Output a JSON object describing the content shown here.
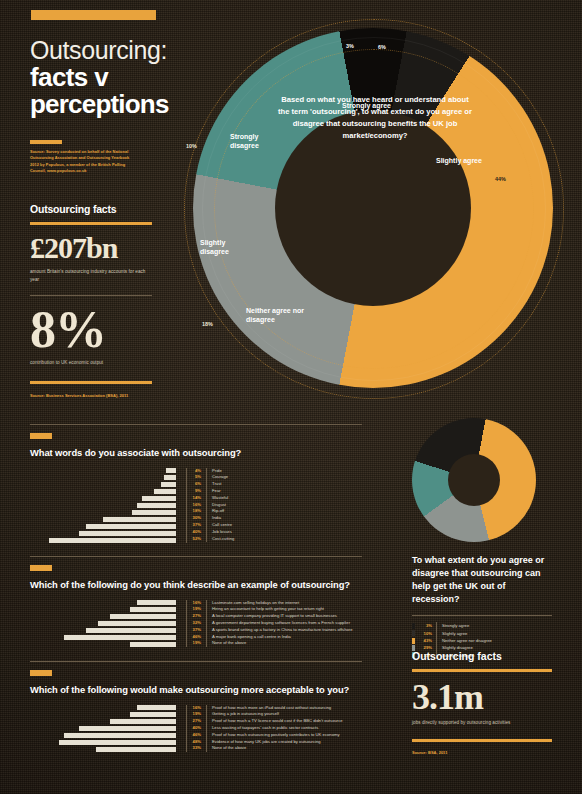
{
  "header": {
    "title_line1": "Outsourcing:",
    "title_line2": "facts v",
    "title_line3": "perceptions",
    "source": "Source: Survey conducted on behalf of the National Outsourcing Association and Outsourcing Yearbook 2012 by Populous, a member of the British Polling Council, www.populous.co.uk"
  },
  "facts_left": {
    "heading": "Outsourcing facts",
    "stat1_value": "£207bn",
    "stat1_caption": "amount Britain's outsourcing industry accounts for each year",
    "stat2_value": "8%",
    "stat2_caption": "contribution to UK economic output",
    "source": "Source: Business Services Association (BSA), 2011"
  },
  "main_donut": {
    "question": "Based on what you have heard or understand about the term 'outsourcing', to what extent do you agree or disagree that outsourcing benefits the UK job market/economy?",
    "labels": {
      "strongly_agree": "Strongly agree",
      "slightly_agree": "Slightly agree",
      "neither": "Neither agree nor disagree",
      "slightly_disagree": "Slightly disagree",
      "strongly_disagree": "Strongly disagree"
    },
    "pct_strongly_agree": "3%",
    "pct_top_small": "6%",
    "pct_slightly_agree": "44%",
    "pct_neither": "18%",
    "pct_slightly_disagree": "18%",
    "pct_strongly_disagree": "10%"
  },
  "chart_data": [
    {
      "type": "bar",
      "title": "What words do you associate with outsourcing?",
      "orientation": "horizontal",
      "categories": [
        "Pride",
        "Courage",
        "Trust",
        "Fear",
        "Wasteful",
        "Disgust",
        "Rip-off",
        "India",
        "Call centre",
        "Job losses",
        "Cost-cutting"
      ],
      "values": [
        4,
        5,
        6,
        9,
        14,
        16,
        18,
        30,
        37,
        40,
        52
      ],
      "labels": [
        "4%",
        "5%",
        "6%",
        "9%",
        "14%",
        "16%",
        "18%",
        "30%",
        "37%",
        "40%",
        "52%"
      ],
      "xlabel": "",
      "ylabel": "",
      "xlim": [
        0,
        60
      ],
      "grid": false,
      "legend": "right"
    },
    {
      "type": "bar",
      "title": "Which of the following do you think describe an example of outsourcing?",
      "orientation": "horizontal",
      "categories": [
        "Lastminute.com selling holidays on the internet",
        "Hiring an accountant to help with getting your tax return right",
        "A local computer company providing IT support to small businesses",
        "A government department buying software licences from a French supplier",
        "A sports brand setting up a factory in China to manufacture trainers offshore",
        "A major bank opening a call centre in India",
        "None of the above"
      ],
      "values": [
        16,
        19,
        27,
        32,
        37,
        46,
        19
      ],
      "labels": [
        "16%",
        "19%",
        "27%",
        "32%",
        "37%",
        "46%",
        "19%"
      ],
      "xlabel": "",
      "ylabel": "",
      "xlim": [
        0,
        60
      ],
      "grid": false,
      "legend": "right"
    },
    {
      "type": "bar",
      "title": "Which of the following would make outsourcing more acceptable to you?",
      "orientation": "horizontal",
      "categories": [
        "Proof of how much more an iPad would cost without outsourcing",
        "Getting a job in outsourcing yourself",
        "Proof of how much a TV licence would cost if the BBC didn't outsource",
        "Less wasting of taxpayers' cash in public sector contracts",
        "Proof of how much outsourcing positively contributes to UK economy",
        "Evidence of how many UK jobs are created by outsourcing",
        "None of the above"
      ],
      "values": [
        16,
        19,
        27,
        40,
        46,
        48,
        33
      ],
      "labels": [
        "16%",
        "19%",
        "27%",
        "40%",
        "46%",
        "48%",
        "33%"
      ],
      "xlabel": "",
      "ylabel": "",
      "xlim": [
        0,
        60
      ],
      "grid": false,
      "legend": "right"
    },
    {
      "type": "pie",
      "title": "To what extent do you agree or disagree that outsourcing can help get the UK out of recession?",
      "categories": [
        "Strongly agree",
        "Slightly agree",
        "Neither agree nor disagree",
        "Slightly disagree",
        "Strongly disagree"
      ],
      "values": [
        3,
        10,
        43,
        29,
        15
      ],
      "labels": [
        "3%",
        "10%",
        "43%",
        "29%",
        "15%"
      ],
      "colors": [
        "#1c1a17",
        "#2f2c28",
        "#eda63f",
        "#8e9490",
        "#4f8f86"
      ],
      "legend": "bottom"
    }
  ],
  "facts_right": {
    "heading": "Outsourcing facts",
    "stat_value": "3.1m",
    "stat_caption": "jobs directly supported by outsourcing activities",
    "source": "Source: BSA, 2011"
  },
  "colors": {
    "accent": "#e8a33d",
    "orange": "#eda63f",
    "teal": "#4f8f86",
    "grey": "#8e9490",
    "dark": "#1c1a17",
    "bg": "#2a2118",
    "bar": "#e6e1d3"
  }
}
